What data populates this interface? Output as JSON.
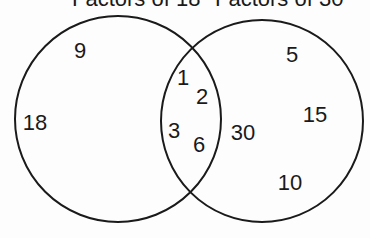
{
  "diagram": {
    "type": "venn",
    "sets": [
      {
        "id": "A",
        "label": "Factors of 18",
        "only": [
          "9",
          "18"
        ]
      },
      {
        "id": "B",
        "label": "Factors of 30",
        "only": [
          "5",
          "15",
          "30",
          "10"
        ]
      }
    ],
    "intersection": [
      "1",
      "2",
      "3",
      "6"
    ],
    "stroke_color": "#1a1a1a"
  },
  "labels": {
    "left_title": "Factors of 18",
    "right_title": "Factors of 30"
  },
  "numbers": {
    "n9": "9",
    "n18": "18",
    "n1": "1",
    "n2": "2",
    "n3": "3",
    "n6": "6",
    "n30": "30",
    "n5": "5",
    "n15": "15",
    "n10": "10"
  }
}
